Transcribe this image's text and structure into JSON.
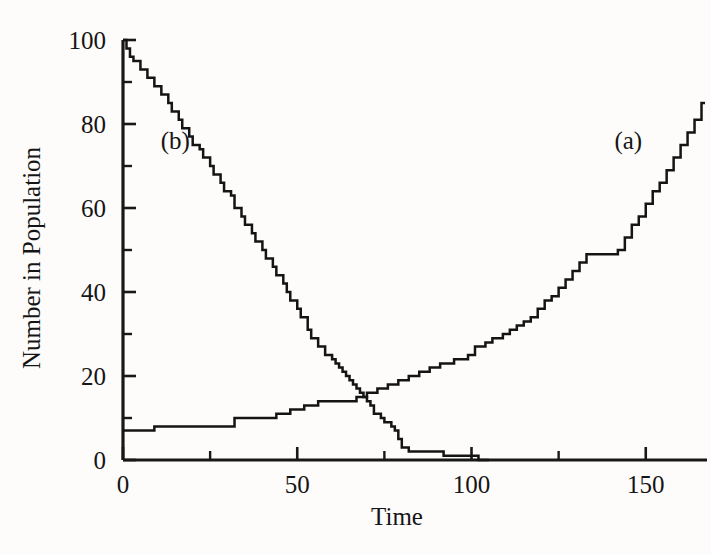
{
  "chart_data": {
    "type": "line",
    "title": "",
    "xlabel": "Time",
    "ylabel": "Number in Population",
    "xlim": [
      0,
      167
    ],
    "ylim": [
      0,
      100
    ],
    "grid": false,
    "legend_position": "inline-annotations",
    "x_ticks_major": [
      0,
      50,
      100,
      150
    ],
    "x_ticks_major_labels": [
      "0",
      "50",
      "100",
      "150"
    ],
    "x_ticks_minor": [
      25,
      75,
      125
    ],
    "y_ticks_major": [
      0,
      20,
      40,
      60,
      80,
      100
    ],
    "y_ticks_major_labels": [
      "0",
      "20",
      "40",
      "60",
      "80",
      "100"
    ],
    "y_ticks_minor": [
      10,
      30,
      50,
      70,
      90
    ],
    "annotations": [
      {
        "text": "(a)",
        "x": 145,
        "y": 74
      },
      {
        "text": "(b)",
        "x": 15,
        "y": 74
      }
    ],
    "series": [
      {
        "name": "(a)",
        "label": "(a)",
        "step": "post",
        "points": [
          [
            0,
            7
          ],
          [
            9,
            7
          ],
          [
            9,
            8
          ],
          [
            20,
            8
          ],
          [
            20,
            8
          ],
          [
            32,
            8
          ],
          [
            32,
            10
          ],
          [
            38,
            10
          ],
          [
            38,
            10
          ],
          [
            44,
            10
          ],
          [
            44,
            11
          ],
          [
            48,
            11
          ],
          [
            48,
            12
          ],
          [
            52,
            12
          ],
          [
            52,
            13
          ],
          [
            56,
            13
          ],
          [
            56,
            14
          ],
          [
            60,
            14
          ],
          [
            60,
            14
          ],
          [
            64,
            14
          ],
          [
            64,
            14
          ],
          [
            67,
            14
          ],
          [
            67,
            15
          ],
          [
            70,
            15
          ],
          [
            70,
            16
          ],
          [
            73,
            16
          ],
          [
            73,
            17
          ],
          [
            76,
            17
          ],
          [
            76,
            18
          ],
          [
            79,
            18
          ],
          [
            79,
            19
          ],
          [
            82,
            19
          ],
          [
            82,
            20
          ],
          [
            85,
            20
          ],
          [
            85,
            21
          ],
          [
            88,
            21
          ],
          [
            88,
            22
          ],
          [
            91,
            22
          ],
          [
            91,
            23
          ],
          [
            95,
            23
          ],
          [
            95,
            24
          ],
          [
            99,
            24
          ],
          [
            99,
            25
          ],
          [
            101,
            25
          ],
          [
            101,
            27
          ],
          [
            104,
            27
          ],
          [
            104,
            28
          ],
          [
            106,
            28
          ],
          [
            106,
            29
          ],
          [
            109,
            29
          ],
          [
            109,
            30
          ],
          [
            111,
            30
          ],
          [
            111,
            31
          ],
          [
            113,
            31
          ],
          [
            113,
            32
          ],
          [
            115,
            32
          ],
          [
            115,
            33
          ],
          [
            117,
            33
          ],
          [
            117,
            34
          ],
          [
            119,
            34
          ],
          [
            119,
            36
          ],
          [
            121,
            36
          ],
          [
            121,
            38
          ],
          [
            123,
            38
          ],
          [
            123,
            39
          ],
          [
            125,
            39
          ],
          [
            125,
            41
          ],
          [
            127,
            41
          ],
          [
            127,
            43
          ],
          [
            129,
            43
          ],
          [
            129,
            45
          ],
          [
            131,
            45
          ],
          [
            131,
            47
          ],
          [
            133,
            47
          ],
          [
            133,
            49
          ],
          [
            136,
            49
          ],
          [
            136,
            49
          ],
          [
            142,
            49
          ],
          [
            142,
            50
          ],
          [
            144,
            50
          ],
          [
            144,
            53
          ],
          [
            146,
            53
          ],
          [
            146,
            56
          ],
          [
            148,
            56
          ],
          [
            148,
            58
          ],
          [
            150,
            58
          ],
          [
            150,
            61
          ],
          [
            152,
            61
          ],
          [
            152,
            64
          ],
          [
            154,
            64
          ],
          [
            154,
            66
          ],
          [
            156,
            66
          ],
          [
            156,
            69
          ],
          [
            158,
            69
          ],
          [
            158,
            72
          ],
          [
            160,
            72
          ],
          [
            160,
            75
          ],
          [
            162,
            75
          ],
          [
            162,
            78
          ],
          [
            164,
            78
          ],
          [
            164,
            81
          ],
          [
            166,
            81
          ],
          [
            166,
            85
          ],
          [
            167,
            85
          ]
        ]
      },
      {
        "name": "(b)",
        "label": "(b)",
        "step": "post",
        "points": [
          [
            0,
            100
          ],
          [
            1,
            100
          ],
          [
            1,
            98
          ],
          [
            2,
            98
          ],
          [
            2,
            96
          ],
          [
            3,
            96
          ],
          [
            3,
            95
          ],
          [
            5,
            95
          ],
          [
            5,
            93
          ],
          [
            7,
            93
          ],
          [
            7,
            91
          ],
          [
            9,
            91
          ],
          [
            9,
            89
          ],
          [
            11,
            89
          ],
          [
            11,
            87
          ],
          [
            13,
            87
          ],
          [
            13,
            85
          ],
          [
            14,
            85
          ],
          [
            14,
            83
          ],
          [
            16,
            83
          ],
          [
            16,
            81
          ],
          [
            17,
            81
          ],
          [
            17,
            79
          ],
          [
            19,
            79
          ],
          [
            19,
            77
          ],
          [
            20,
            77
          ],
          [
            20,
            75
          ],
          [
            22,
            75
          ],
          [
            22,
            74
          ],
          [
            23,
            74
          ],
          [
            23,
            72
          ],
          [
            25,
            72
          ],
          [
            25,
            70
          ],
          [
            26,
            70
          ],
          [
            26,
            68
          ],
          [
            28,
            68
          ],
          [
            28,
            66
          ],
          [
            29,
            66
          ],
          [
            29,
            64
          ],
          [
            31,
            64
          ],
          [
            31,
            63
          ],
          [
            32,
            63
          ],
          [
            32,
            60
          ],
          [
            34,
            60
          ],
          [
            34,
            58
          ],
          [
            35,
            58
          ],
          [
            35,
            56
          ],
          [
            37,
            56
          ],
          [
            37,
            54
          ],
          [
            38,
            54
          ],
          [
            38,
            52
          ],
          [
            40,
            52
          ],
          [
            40,
            50
          ],
          [
            41,
            50
          ],
          [
            41,
            48
          ],
          [
            43,
            48
          ],
          [
            43,
            46
          ],
          [
            44,
            46
          ],
          [
            44,
            44
          ],
          [
            46,
            44
          ],
          [
            46,
            42
          ],
          [
            47,
            42
          ],
          [
            47,
            40
          ],
          [
            48,
            40
          ],
          [
            48,
            38
          ],
          [
            50,
            38
          ],
          [
            50,
            36
          ],
          [
            51,
            36
          ],
          [
            51,
            34
          ],
          [
            53,
            34
          ],
          [
            53,
            31
          ],
          [
            54,
            31
          ],
          [
            54,
            29
          ],
          [
            56,
            29
          ],
          [
            56,
            27
          ],
          [
            58,
            27
          ],
          [
            58,
            25
          ],
          [
            60,
            25
          ],
          [
            60,
            24
          ],
          [
            61,
            24
          ],
          [
            61,
            23
          ],
          [
            62,
            23
          ],
          [
            62,
            22
          ],
          [
            63,
            22
          ],
          [
            63,
            21
          ],
          [
            64,
            21
          ],
          [
            64,
            20
          ],
          [
            65,
            20
          ],
          [
            65,
            19
          ],
          [
            66,
            19
          ],
          [
            66,
            18
          ],
          [
            67,
            18
          ],
          [
            67,
            17
          ],
          [
            68,
            17
          ],
          [
            68,
            16
          ],
          [
            69,
            16
          ],
          [
            69,
            15
          ],
          [
            70,
            15
          ],
          [
            70,
            14
          ],
          [
            71,
            14
          ],
          [
            71,
            13
          ],
          [
            72,
            13
          ],
          [
            72,
            11
          ],
          [
            74,
            11
          ],
          [
            74,
            10
          ],
          [
            75,
            10
          ],
          [
            75,
            9
          ],
          [
            77,
            9
          ],
          [
            77,
            8
          ],
          [
            78,
            8
          ],
          [
            78,
            7
          ],
          [
            79,
            7
          ],
          [
            79,
            5
          ],
          [
            80,
            5
          ],
          [
            80,
            3
          ],
          [
            82,
            3
          ],
          [
            82,
            2
          ],
          [
            86,
            2
          ],
          [
            86,
            2
          ],
          [
            90,
            2
          ],
          [
            90,
            2
          ],
          [
            92,
            2
          ],
          [
            92,
            1
          ],
          [
            96,
            1
          ],
          [
            96,
            1
          ],
          [
            100,
            1
          ],
          [
            100,
            1
          ],
          [
            102,
            1
          ],
          [
            102,
            0
          ],
          [
            105,
            0
          ]
        ]
      }
    ]
  },
  "figure": {
    "background_color": "#fdfcfa",
    "line_color": "#141414",
    "axis_color": "#181818"
  }
}
